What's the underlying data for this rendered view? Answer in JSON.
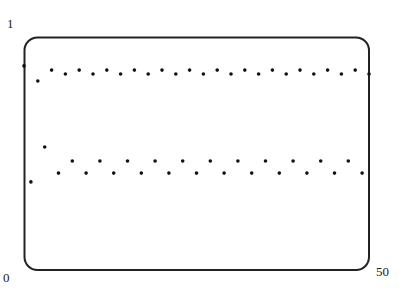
{
  "chart_data": {
    "type": "scatter",
    "title": "",
    "xlabel": "",
    "ylabel": "",
    "xlim": [
      0,
      50
    ],
    "ylim": [
      0,
      1
    ],
    "grid": false,
    "legend": null,
    "tick_labels": {
      "y_top": "1",
      "x_min": "0",
      "x_max": "50"
    },
    "frame": {
      "rounded_corners": true
    },
    "series": [
      {
        "name": "sequence",
        "x": [
          0,
          1,
          2,
          3,
          4,
          5,
          6,
          7,
          8,
          9,
          10,
          11,
          12,
          13,
          14,
          15,
          16,
          17,
          18,
          19,
          20,
          21,
          22,
          23,
          24,
          25,
          26,
          27,
          28,
          29,
          30,
          31,
          32,
          33,
          34,
          35,
          36,
          37,
          38,
          39,
          40,
          41,
          42,
          43,
          44,
          45,
          46,
          47,
          48,
          49,
          50
        ],
        "y": [
          0.876,
          0.378,
          0.811,
          0.528,
          0.858,
          0.416,
          0.841,
          0.468,
          0.858,
          0.416,
          0.841,
          0.468,
          0.858,
          0.416,
          0.841,
          0.468,
          0.858,
          0.416,
          0.841,
          0.468,
          0.858,
          0.416,
          0.841,
          0.468,
          0.858,
          0.416,
          0.841,
          0.468,
          0.858,
          0.416,
          0.841,
          0.468,
          0.858,
          0.416,
          0.841,
          0.468,
          0.858,
          0.416,
          0.841,
          0.468,
          0.858,
          0.416,
          0.841,
          0.468,
          0.858,
          0.416,
          0.841,
          0.468,
          0.858,
          0.416,
          0.841
        ]
      }
    ]
  },
  "colors": {
    "frame": "#222222",
    "points": "#111111",
    "background": "#ffffff"
  }
}
